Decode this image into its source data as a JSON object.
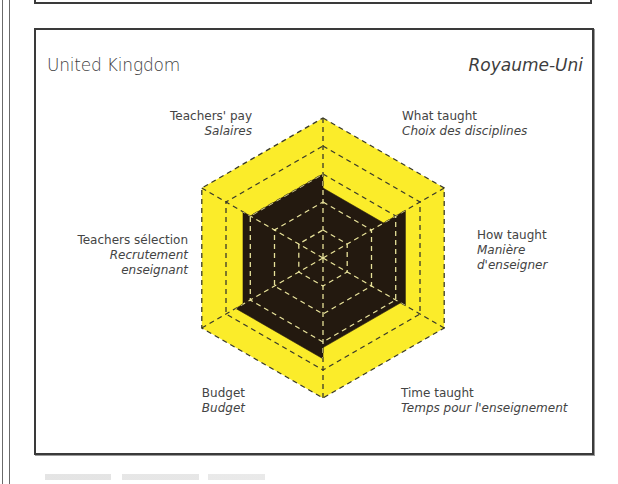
{
  "panel": {
    "title_en": "United Kingdom",
    "title_fr": "Royaume-Uni"
  },
  "axes": [
    {
      "en": "Teachers' pay",
      "fr": "Salaires"
    },
    {
      "en": "What taught",
      "fr": "Choix des disciplines"
    },
    {
      "en": "How taught",
      "fr": "Manière",
      "fr2": "d'enseigner"
    },
    {
      "en": "Time taught",
      "fr": "Temps pour l'enseignement"
    },
    {
      "en": "Budget",
      "fr": "Budget"
    },
    {
      "en": "Teachers sélection",
      "fr": "Recrutement",
      "fr2": "enseignant"
    }
  ],
  "colors": {
    "background_fill": "#fbec2a",
    "data_fill": "#23190f",
    "grid_on_yellow": "#3a3a2a",
    "grid_on_dark": "#e8e29a",
    "frame": "#3a3a3a"
  },
  "chart_data": {
    "type": "radar",
    "categories": [
      "Teachers' pay / Salaires",
      "What taught / Choix des disciplines",
      "How taught / Manière d'enseigner",
      "Time taught / Temps pour l'enseignement",
      "Budget / Budget",
      "Teachers sélection / Recrutement enseignant"
    ],
    "series": [
      {
        "name": "United Kingdom",
        "values": [
          3.0,
          2.5,
          3.4,
          3.2,
          3.6,
          3.3
        ]
      }
    ],
    "scale": {
      "min": 0,
      "max": 5,
      "rings": 5
    },
    "grid": "dashed concentric hexagons",
    "legend": "none",
    "note": "Pointy-top hexagon; each category occupies one triangular sector (edge), filled from centre to its level."
  }
}
